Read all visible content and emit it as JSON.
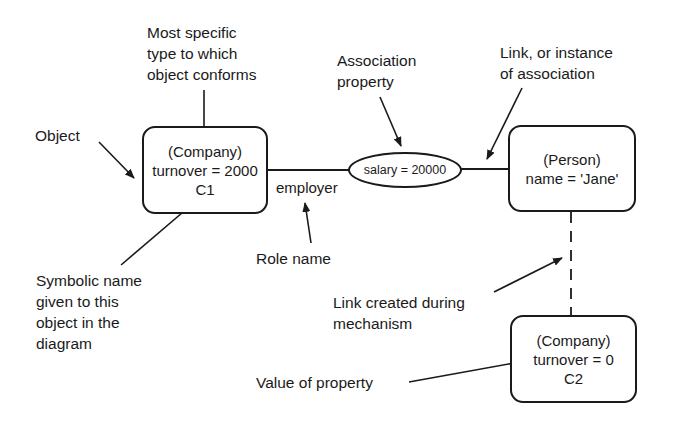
{
  "diagram": {
    "objects": [
      {
        "id": "c1",
        "type_label": "(Company)",
        "property": "turnover = 2000",
        "symbol": "C1"
      },
      {
        "id": "person",
        "type_label": "(Person)",
        "property": "name = 'Jane'"
      },
      {
        "id": "c2",
        "type_label": "(Company)",
        "property": "turnover = 0",
        "symbol": "C2"
      }
    ],
    "association_property": "salary = 20000",
    "role_name": "employer",
    "annotations": {
      "most_specific_type": [
        "Most specific",
        "type to which",
        "object conforms"
      ],
      "object": "Object",
      "association_property": [
        "Association",
        "property"
      ],
      "link_instance": [
        "Link, or instance",
        "of association"
      ],
      "role_name": "Role name",
      "symbolic_name": [
        "Symbolic name",
        "given to this",
        "object in the",
        "diagram"
      ],
      "link_created": [
        "Link created during",
        "mechanism"
      ],
      "value_of_property": "Value of property"
    }
  }
}
